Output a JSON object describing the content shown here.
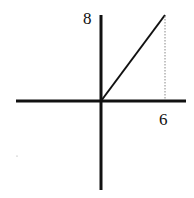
{
  "diagram": {
    "type": "coordinate-axes-with-line",
    "labels": {
      "y_tick": "8",
      "x_tick": "6"
    },
    "line": {
      "from": [
        0,
        0
      ],
      "to": [
        6,
        8
      ]
    },
    "dotted_drop": {
      "x": 6,
      "from_y": 8,
      "to_y": 0
    },
    "colors": {
      "ink": "#111111",
      "dotted": "#888888"
    }
  }
}
